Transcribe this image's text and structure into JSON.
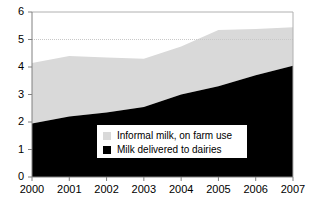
{
  "chart_data": {
    "type": "area",
    "stacked": true,
    "title": "",
    "xlabel": "",
    "ylabel": "",
    "categories": [
      "2000",
      "2001",
      "2002",
      "2003",
      "2004",
      "2005",
      "2006",
      "2007"
    ],
    "x": [
      2000,
      2001,
      2002,
      2003,
      2004,
      2005,
      2006,
      2007
    ],
    "ylim": [
      0,
      6
    ],
    "xlim": [
      2000,
      2007
    ],
    "yticks": [
      0,
      1,
      2,
      3,
      4,
      5,
      6
    ],
    "ytick_labels": [
      "0",
      "1",
      "2",
      "3",
      "4",
      "5",
      "6"
    ],
    "xtick_labels": [
      "2000",
      "2001",
      "2002",
      "2003",
      "2004",
      "2005",
      "2006",
      "2007"
    ],
    "grid": "horizontal-dotted-at-5",
    "gridlines": [
      5
    ],
    "legend_position": "inside-center-bottom",
    "series": [
      {
        "name": "Milk delivered to dairies",
        "color": "#000000",
        "values": [
          1.95,
          2.2,
          2.35,
          2.55,
          3.0,
          3.3,
          3.7,
          4.05
        ]
      },
      {
        "name": "Informal milk, on farm use",
        "color": "#d9d9d9",
        "values": [
          2.2,
          2.2,
          2.0,
          1.75,
          1.75,
          2.05,
          1.68,
          1.4
        ]
      }
    ],
    "cumulative_top": [
      4.15,
      4.4,
      4.35,
      4.3,
      4.75,
      5.35,
      5.38,
      5.45
    ]
  },
  "legend": {
    "entries": [
      {
        "label": "Informal milk, on farm use",
        "color": "#d9d9d9"
      },
      {
        "label": "Milk delivered to dairies",
        "color": "#000000"
      }
    ]
  },
  "colors": {
    "series_gray": "#d9d9d9",
    "series_black": "#000000",
    "axis": "#808080",
    "frame": "#b0b0b0",
    "gridline": "#c8c8c8",
    "background": "#ffffff"
  }
}
